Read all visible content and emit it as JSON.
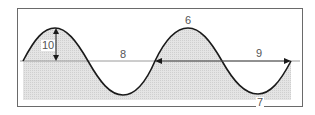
{
  "diagram": {
    "type": "sine-wave-annotated",
    "colors": {
      "frame": "#6a6a6a",
      "curve": "#1a1a1a",
      "fill": "#d8d8d8",
      "axis": "#9a9a9a",
      "label": "#555555"
    },
    "labels": {
      "amplitude": "10",
      "wavelength_top": "8",
      "crest": "6",
      "wavelength_arrow": "9",
      "trough": "7"
    }
  }
}
